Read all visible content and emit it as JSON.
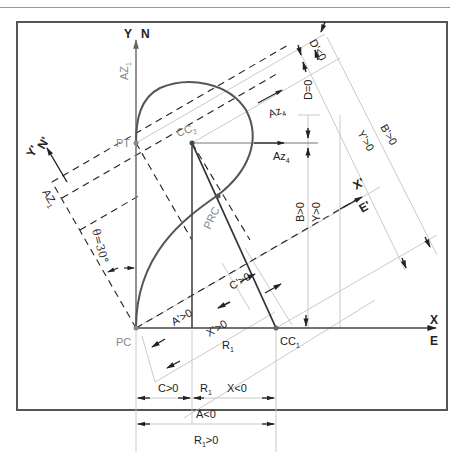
{
  "figure": {
    "type": "survey-curve-geometry",
    "rotation_angle_label": "θ=30°",
    "colors": {
      "frame": "#555555",
      "line": "#333333",
      "light_line": "#bbbbbb",
      "gray_text": "#888888",
      "curve": "#555555"
    }
  },
  "axes": {
    "y": "Y",
    "n": "N",
    "x": "X",
    "e": "E",
    "y_prime": "Y'",
    "n_prime": "N'",
    "x_prime": "X'",
    "e_prime": "E'"
  },
  "points": {
    "pc": "PC",
    "pt": "PT",
    "prc": "PRC",
    "cc1": "CC",
    "cc1_sub": "1",
    "cc2": "CC",
    "cc2_sub": "2"
  },
  "azimuths": {
    "az1": "AZ",
    "az1_sub": "1",
    "az1_prime": "AZ",
    "az1_prime_sub": "1",
    "az4": "Az",
    "az4_sub": "4",
    "az4_prime": "Az",
    "az4_prime_sub": "4"
  },
  "dimensions": {
    "d_prime": "D'<0",
    "d": "D=0",
    "y_prime": "Y'>0",
    "b_prime": "B'>0",
    "b": "B>0",
    "y": "Y>0",
    "a_prime": "A'>0",
    "c_prime": "C'>0",
    "x_prime": "X'>0",
    "r1_label": "R",
    "r1_sub": "1",
    "c": "C>0",
    "r1_bottom": "R",
    "r1_bottom_sub": "1",
    "x": "X<0",
    "a": "A<0",
    "r1_total": "R",
    "r1_total_sub": "1",
    "r1_total_suffix": ">0"
  }
}
